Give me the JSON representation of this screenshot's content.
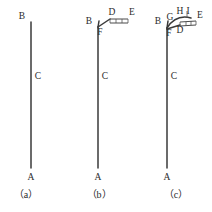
{
  "figure": {
    "background_color": "#ffffff",
    "line_color": "#3a3a3a",
    "label_color": "#2b2b2b",
    "panels": [
      {
        "id": "a",
        "caption": "（a）",
        "labels": {
          "top": "B",
          "middle": "C",
          "bottom": "A"
        }
      },
      {
        "id": "b",
        "caption": "（b）",
        "labels": {
          "top": "B",
          "middle": "C",
          "bottom": "A",
          "bend": "F",
          "bar_near": "D",
          "bar_far": "E"
        }
      },
      {
        "id": "c",
        "caption": "（c）",
        "labels": {
          "top": "B",
          "middle": "C",
          "bottom": "A",
          "bend": "F",
          "bar_near": "D",
          "bar_far": "E",
          "arc_left": "G",
          "arc_mid": "H",
          "arc_right": "I"
        }
      }
    ]
  }
}
